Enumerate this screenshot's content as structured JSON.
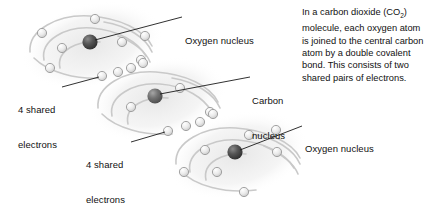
{
  "figure": {
    "caption": {
      "part1": "In a carbon dioxide (CO",
      "subscript": "2",
      "part2": ") molecule, each oxygen atom is joined to the central carbon atom by a double covalent bond. This consists of two shared pairs of electrons."
    },
    "labels": {
      "oxygen_top": "Oxygen nucleus",
      "carbon_line1": "Carbon",
      "carbon_line2": "nucleus",
      "oxygen_bottom": "Oxygen nucleus",
      "shared_top_line1": "4 shared",
      "shared_top_line2": "electrons",
      "shared_bottom_line1": "4 shared",
      "shared_bottom_line2": "electrons"
    },
    "colors": {
      "background": "#ffffff",
      "text": "#111111",
      "leader_line": "#1a1a1a",
      "oxygen_nucleus": "#4a4a4a",
      "carbon_nucleus": "#6b6b6b",
      "electron_fill": "#e3e3e3",
      "electron_stroke": "#9a9a9a",
      "orbit_stroke": "#cccccc",
      "cloud_fill": "#ededed"
    },
    "atoms": [
      {
        "name": "oxygen-left",
        "element": "O",
        "nucleus": {
          "cx": 90,
          "cy": 42,
          "r": 7.5
        },
        "electron_count": 8
      },
      {
        "name": "carbon-center",
        "element": "C",
        "nucleus": {
          "cx": 155,
          "cy": 96,
          "r": 7.5
        },
        "electron_count": 6
      },
      {
        "name": "oxygen-right",
        "element": "O",
        "nucleus": {
          "cx": 235,
          "cy": 152,
          "r": 7.5
        },
        "electron_count": 8
      }
    ],
    "shared_electron_groups": [
      {
        "name": "shared-electrons-left-bond",
        "count": 4
      },
      {
        "name": "shared-electrons-right-bond",
        "count": 4
      }
    ]
  }
}
